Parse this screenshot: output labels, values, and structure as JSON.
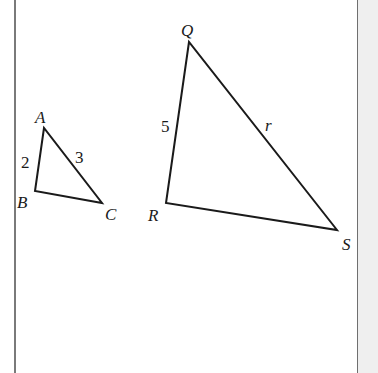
{
  "figure": {
    "small_triangle": {
      "vertices": {
        "A": "A",
        "B": "B",
        "C": "C"
      },
      "side_labels": {
        "AB": "2",
        "AC": "3"
      }
    },
    "large_triangle": {
      "vertices": {
        "Q": "Q",
        "R": "R",
        "S": "S"
      },
      "side_labels": {
        "QR": "5",
        "QS": "r"
      }
    },
    "stroke_color": "#1a1a1a",
    "border_color": "#7a7a7a",
    "panel_color": "#efefef"
  }
}
